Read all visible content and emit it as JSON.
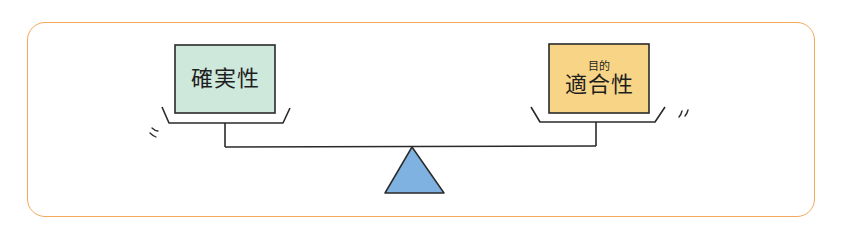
{
  "diagram": {
    "type": "balance-scale",
    "frame_color": "#f3a85a",
    "left_pan": {
      "label": "確実性",
      "ruby": "",
      "fill_color": "#cfe8dc",
      "position": "raised"
    },
    "right_pan": {
      "label": "適合性",
      "ruby": "目的",
      "fill_color": "#f8d586",
      "position": "lowered"
    },
    "fulcrum": {
      "shape": "triangle",
      "fill_color": "#7fb2e0"
    },
    "motion_marks": {
      "left": "〃",
      "right": "”"
    }
  }
}
